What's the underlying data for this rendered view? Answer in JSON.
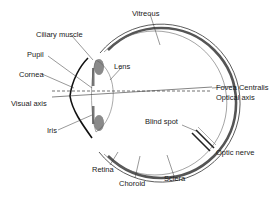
{
  "diagram": {
    "labels": {
      "vitreous": "Vitreous",
      "ciliary_muscle": "Ciliary muscle",
      "pupil": "Pupil",
      "lens": "Lens",
      "cornea": "Cornea",
      "fovea_centralis": "Fovea Centralis",
      "optical_axis": "Optical axis",
      "visual_axis": "Visual axis",
      "iris": "Iris",
      "blind_spot": "Blind spot",
      "optic_nerve": "Optic nerve",
      "retina": "Retina",
      "choroid": "Choroid",
      "sclera": "Sclera"
    },
    "colors": {
      "line": "#222222",
      "choroid_band": "#555555",
      "iris_fill": "#8a8a8a",
      "background": "#ffffff"
    }
  }
}
